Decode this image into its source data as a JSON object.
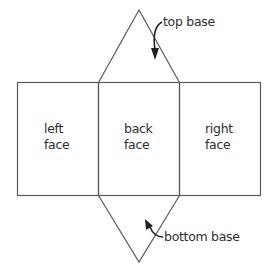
{
  "diagram": {
    "type": "net-of-triangular-prism",
    "colors": {
      "line": "#5a5a5a",
      "text": "#2e2e2e",
      "background": "#ffffff"
    },
    "faces": [
      {
        "id": "left",
        "line1": "left",
        "line2": "face"
      },
      {
        "id": "back",
        "line1": "back",
        "line2": "face"
      },
      {
        "id": "right",
        "line1": "right",
        "line2": "face"
      }
    ],
    "callouts": {
      "top": {
        "label": "top base"
      },
      "bottom": {
        "label": "bottom base"
      }
    }
  }
}
